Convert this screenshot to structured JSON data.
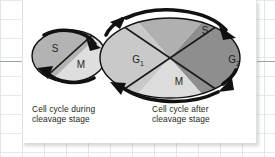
{
  "figure": {
    "type": "biology-diagram",
    "background": {
      "kind": "spreadsheet-grid",
      "grid_color": "#e2e6ea",
      "rule_color": "#9aa3ac",
      "panel_color": "#ffffff"
    },
    "diagrams": [
      {
        "id": "cleavage-cycle",
        "shape": "ellipse",
        "size": "small",
        "caption": "Cell cycle during\ncleavage stage",
        "rotation": "clockwise",
        "divisions": 2,
        "phases": [
          {
            "label": "S",
            "position": "upper-left",
            "fill": "#b3b3b3"
          },
          {
            "label": "M",
            "position": "lower-right",
            "fill": "#dedede"
          }
        ],
        "arrows": [
          {
            "position": "top-right",
            "direction": "right"
          },
          {
            "position": "bottom-left",
            "direction": "left"
          }
        ]
      },
      {
        "id": "post-cleavage-cycle",
        "shape": "ellipse",
        "size": "large",
        "caption": "Cell cycle after\ncleavage stage",
        "rotation": "clockwise",
        "divisions": 4,
        "phases": [
          {
            "label": "G₁",
            "base": "G",
            "subscript": "1",
            "position": "left",
            "fill": "#c9c9c9"
          },
          {
            "label": "S",
            "base": "S",
            "subscript": "",
            "position": "top",
            "fill": "#b0b0b0"
          },
          {
            "label": "G₂",
            "base": "G",
            "subscript": "2",
            "position": "right",
            "fill": "#8e8e8e"
          },
          {
            "label": "M",
            "base": "M",
            "subscript": "",
            "position": "bottom",
            "fill": "#dcdcdc"
          }
        ],
        "arrows": [
          {
            "position": "top-left",
            "direction": "up-left"
          },
          {
            "position": "top-right",
            "direction": "right"
          },
          {
            "position": "bottom-right",
            "direction": "down-right"
          },
          {
            "position": "bottom-left",
            "direction": "left"
          }
        ]
      }
    ],
    "labels": {
      "small_s": "S",
      "small_m": "M",
      "large_g1_base": "G",
      "large_g1_sub": "1",
      "large_s": "S",
      "large_g2_base": "G",
      "large_g2_sub": "2",
      "large_m": "M"
    },
    "captions": {
      "left": "Cell cycle during\ncleavage stage",
      "right": "Cell cycle after\ncleavage stage"
    },
    "colors": {
      "outline": "#111111",
      "text": "#231f20",
      "divider": "#1a1a1a"
    }
  }
}
